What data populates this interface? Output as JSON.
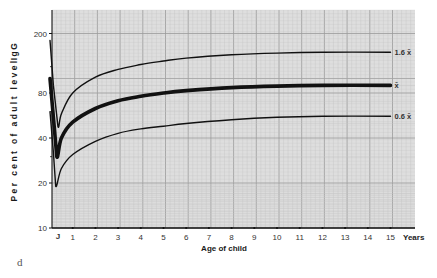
{
  "chart_data": {
    "type": "line",
    "title": "",
    "ylabel": "Per cent of adult level",
    "ylabel_secondary": "IgG",
    "xlabel": "Age of child",
    "x_unit_label": "Years",
    "yscale": "log",
    "ylim": [
      10,
      250
    ],
    "xlim": [
      0,
      15
    ],
    "yticks": [
      10,
      20,
      40,
      80,
      200
    ],
    "xticks": [
      1,
      2,
      3,
      4,
      5,
      6,
      7,
      8,
      9,
      10,
      11,
      12,
      13,
      14,
      15
    ],
    "x_extra_tick_label": "J",
    "grid": true,
    "legend_position": "inline-right",
    "panel_label": "d",
    "series": [
      {
        "name": "1.6 x̄",
        "stroke_width": 1.4,
        "x": [
          0,
          0.15,
          0.35,
          0.5,
          1,
          2,
          3,
          4,
          5,
          6,
          8,
          10,
          12,
          15
        ],
        "values": [
          180,
          90,
          48,
          58,
          80,
          102,
          115,
          124,
          131,
          137,
          144,
          148,
          150,
          150
        ]
      },
      {
        "name": "x̄",
        "stroke_width": 3.6,
        "x": [
          0,
          0.15,
          0.3,
          0.5,
          1,
          2,
          3,
          4,
          5,
          6,
          8,
          10,
          12,
          15
        ],
        "values": [
          100,
          55,
          30,
          40,
          51,
          63,
          71,
          76,
          80,
          83,
          87,
          89,
          90,
          90
        ]
      },
      {
        "name": "0.6 x̄",
        "stroke_width": 1.4,
        "x": [
          0,
          0.15,
          0.25,
          0.5,
          1,
          2,
          3,
          4,
          5,
          6,
          8,
          10,
          12,
          15
        ],
        "values": [
          60,
          32,
          19,
          25,
          31,
          38,
          43,
          46,
          48,
          50,
          53,
          55,
          56,
          56
        ]
      }
    ]
  },
  "labels": {
    "ylabel": "Per cent of adult level",
    "ylabel_ig": "IgG",
    "xlabel": "Age of child",
    "years": "Years",
    "panel": "d",
    "j_tick": "J"
  },
  "colors": {
    "grid_bg": "#dedede",
    "grid_minor": "#c4c4c4",
    "grid_major": "#9a9a9a",
    "curve": "#111111",
    "axis": "#111111"
  }
}
